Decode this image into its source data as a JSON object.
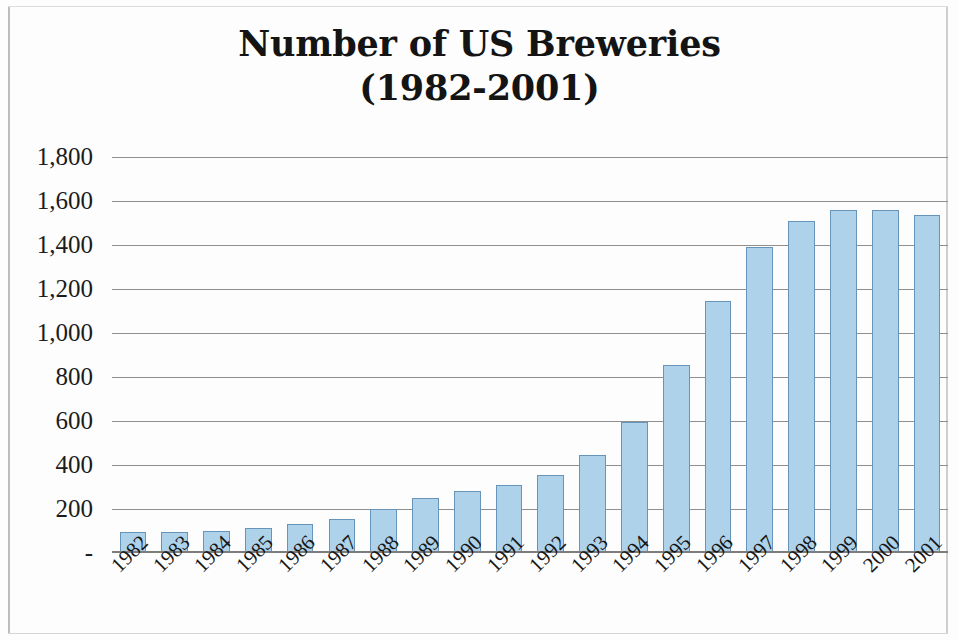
{
  "chart_data": {
    "type": "bar",
    "title": "Number of US Breweries (1982-2001)",
    "title_line1": "Number of US Breweries",
    "title_line2": "(1982-2001)",
    "xlabel": "",
    "ylabel": "",
    "grid": true,
    "legend": false,
    "ylim": [
      0,
      1800
    ],
    "ytick_values": [
      1800,
      1600,
      1400,
      1200,
      1000,
      800,
      600,
      400,
      200,
      0
    ],
    "ytick_labels": [
      "1,800",
      "1,600",
      "1,400",
      "1,200",
      "1,000",
      "800",
      "600",
      "400",
      "200",
      "-"
    ],
    "categories": [
      "1982",
      "1983",
      "1984",
      "1985",
      "1986",
      "1987",
      "1988",
      "1989",
      "1990",
      "1991",
      "1992",
      "1993",
      "1994",
      "1995",
      "1996",
      "1997",
      "1998",
      "1999",
      "2000",
      "2001"
    ],
    "values": [
      95,
      95,
      100,
      115,
      130,
      155,
      200,
      250,
      283,
      310,
      355,
      445,
      595,
      855,
      1145,
      1390,
      1510,
      1560,
      1560,
      1535
    ],
    "series": [
      {
        "name": "Number of US Breweries",
        "values": [
          95,
          95,
          100,
          115,
          130,
          155,
          200,
          250,
          283,
          310,
          355,
          445,
          595,
          855,
          1145,
          1390,
          1510,
          1560,
          1560,
          1535
        ]
      }
    ],
    "colors": {
      "bar_fill": "#aed2ea",
      "bar_border": "#6795ba",
      "gridline": "#8f8f8f",
      "axis": "#7d7d7d",
      "text": "#161616",
      "background": "#fdfdfd"
    }
  }
}
